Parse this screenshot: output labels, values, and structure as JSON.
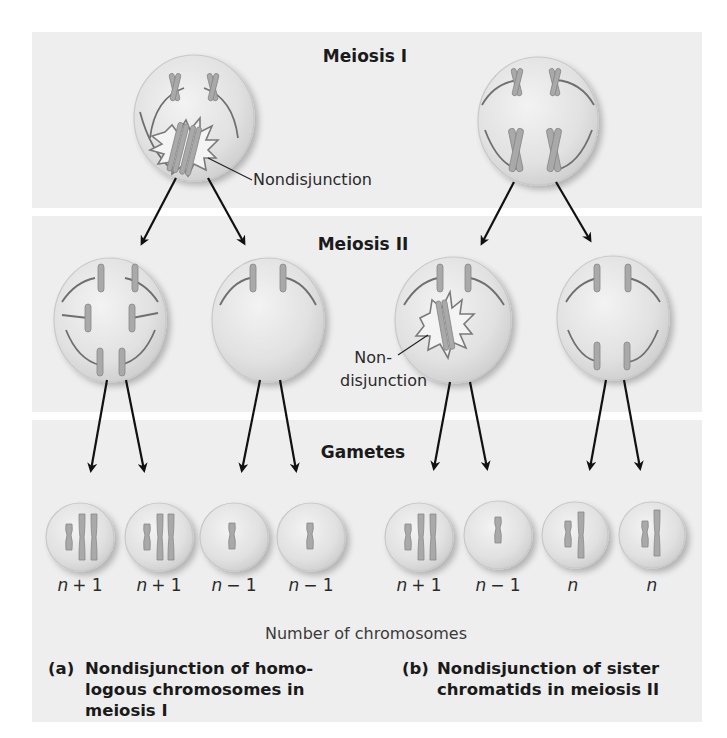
{
  "stages": {
    "meiosis1": "Meiosis I",
    "meiosis2": "Meiosis II",
    "gametes": "Gametes"
  },
  "annotations": {
    "nondisjunction_a": "Nondisjunction",
    "nondisjunction_b_line1": "Non-",
    "nondisjunction_b_line2": "disjunction"
  },
  "gametes": {
    "a": [
      {
        "n": "n",
        "op": "+ 1"
      },
      {
        "n": "n",
        "op": "+ 1"
      },
      {
        "n": "n",
        "op": "− 1"
      },
      {
        "n": "n",
        "op": "− 1"
      }
    ],
    "b": [
      {
        "n": "n",
        "op": "+ 1"
      },
      {
        "n": "n",
        "op": "− 1"
      },
      {
        "n": "n",
        "op": ""
      },
      {
        "n": "n",
        "op": ""
      }
    ]
  },
  "axis_label": "Number of chromosomes",
  "captions": {
    "a": {
      "tag": "(a)",
      "lines": [
        "Nondisjunction of homo-",
        "logous chromosomes in",
        "meiosis I"
      ]
    },
    "b": {
      "tag": "(b)",
      "lines": [
        "Nondisjunction of sister",
        "chromatids in meiosis II"
      ]
    }
  },
  "colors": {
    "band": "#eeeeee",
    "cell_fill": "#e2e2e2",
    "chromosome": "#a9a9a9",
    "spindle": "#6f6f6f",
    "arrow": "#111111"
  }
}
